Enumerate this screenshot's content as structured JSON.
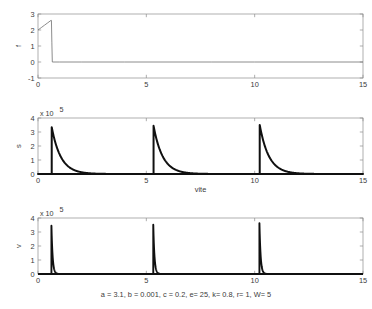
{
  "figure": {
    "caption": "a = 3.1, b = 0.001, c = 0.2, e= 25, k= 0.8, r= 1, W= 5"
  },
  "chart_data": [
    {
      "type": "line",
      "panel": "top",
      "title": "",
      "xlabel": "",
      "ylabel": "f",
      "xlim": [
        0,
        15
      ],
      "ylim": [
        -1,
        3
      ],
      "xticks": [
        0,
        5,
        10,
        15
      ],
      "xticklabels": [
        "0",
        "5",
        "10",
        "15"
      ],
      "yticks": [
        -1,
        0,
        1,
        2,
        3
      ],
      "yticklabels": [
        "-1",
        "0",
        "1",
        "2",
        "3"
      ],
      "y_multiplier": "",
      "grid": false,
      "legend": "none",
      "series": [
        {
          "name": "f",
          "x": [
            0.0,
            0.15,
            0.3,
            0.45,
            0.6,
            0.62,
            0.64,
            0.66,
            1.0,
            2.0,
            4.0,
            6.0,
            8.0,
            10.0,
            12.0,
            15.0
          ],
          "values": [
            2.0,
            2.15,
            2.3,
            2.45,
            2.6,
            2.6,
            1.2,
            0.0,
            0.0,
            0.0,
            0.0,
            0.0,
            0.0,
            0.0,
            0.0,
            0.0
          ]
        }
      ]
    },
    {
      "type": "line",
      "panel": "middle",
      "title": "",
      "xlabel": "vite",
      "ylabel": "s",
      "xlim": [
        0,
        15
      ],
      "ylim": [
        0,
        4
      ],
      "xticks": [
        0,
        5,
        10,
        15
      ],
      "xticklabels": [
        "0",
        "5",
        "10",
        "15"
      ],
      "yticks": [
        0,
        1,
        2,
        3,
        4
      ],
      "yticklabels": [
        "0",
        "1",
        "2",
        "3",
        "4"
      ],
      "y_multiplier": "x 10",
      "y_exponent": "5",
      "grid": false,
      "legend": "none",
      "spikes": [
        {
          "peak_x": 0.62,
          "peak_y": 3.45,
          "decay": 0.42
        },
        {
          "peak_x": 5.32,
          "peak_y": 3.55,
          "decay": 0.42
        },
        {
          "peak_x": 10.22,
          "peak_y": 3.62,
          "decay": 0.42
        }
      ]
    },
    {
      "type": "line",
      "panel": "bottom",
      "title": "",
      "xlabel": "",
      "ylabel": "v",
      "xlim": [
        0,
        15
      ],
      "ylim": [
        0,
        4
      ],
      "xticks": [
        0,
        5,
        10,
        15
      ],
      "xticklabels": [
        "0",
        "5",
        "10",
        "15"
      ],
      "yticks": [
        0,
        1,
        2,
        3,
        4
      ],
      "yticklabels": [
        "0",
        "1",
        "2",
        "3",
        "4"
      ],
      "y_multiplier": "x 10",
      "y_exponent": "5",
      "grid": false,
      "legend": "none",
      "spikes": [
        {
          "peak_x": 0.62,
          "peak_y": 3.45,
          "decay": 0.055
        },
        {
          "peak_x": 5.32,
          "peak_y": 3.52,
          "decay": 0.055
        },
        {
          "peak_x": 10.22,
          "peak_y": 3.62,
          "decay": 0.055
        }
      ]
    }
  ]
}
